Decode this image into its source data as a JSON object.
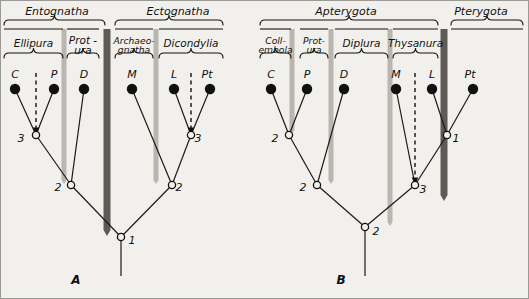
{
  "figure": {
    "background_color": "#f2f0ec",
    "ink_color": "#14120f",
    "light_bar_color": "#b9b6b0",
    "dark_bar_color": "#5e5b56",
    "panels": [
      {
        "id": "A",
        "label": "A",
        "label_x": 75,
        "label_y": 283,
        "upper_groups": [
          {
            "name": "Entognatha",
            "text_x": 56,
            "text_y": 14,
            "bracket_x1": 3,
            "bracket_x2": 104,
            "bracket_y": 24
          },
          {
            "name": "Ectognatha",
            "text_x": 177,
            "text_y": 14,
            "bracket_x1": 114,
            "bracket_x2": 222,
            "bracket_y": 24
          }
        ],
        "lower_groups": [
          {
            "name": "Ellipura",
            "lines": [
              "Ellipura"
            ],
            "text_x": 34,
            "text_y": 46,
            "bracket_x1": 3,
            "bracket_x2": 62,
            "bracket_y": 57,
            "small": false
          },
          {
            "name": "Protura",
            "lines": [
              "Prot -",
              "ura"
            ],
            "text_x": 80,
            "text_y": 43,
            "bracket_x1": 66,
            "bracket_x2": 98,
            "bracket_y": 57,
            "small": false
          },
          {
            "name": "Archaeognatha",
            "lines": [
              "Archaeo-",
              "gnatha"
            ],
            "text_x": 133,
            "text_y": 43,
            "bracket_x1": 114,
            "bracket_x2": 152,
            "bracket_y": 57,
            "small": true
          },
          {
            "name": "Dicondylia",
            "lines": [
              "Dicondylia"
            ],
            "text_x": 192,
            "text_y": 46,
            "bracket_x1": 158,
            "bracket_x2": 222,
            "bracket_y": 57,
            "small": false
          }
        ],
        "tips": [
          {
            "code": "C",
            "label_x": 11,
            "label_y": 77,
            "dot_x": 14,
            "dot_y": 88
          },
          {
            "code": "P",
            "label_x": 50,
            "label_y": 77,
            "dot_x": 53,
            "dot_y": 88
          },
          {
            "code": "D",
            "label_x": 80,
            "label_y": 77,
            "dot_x": 83,
            "dot_y": 88
          },
          {
            "code": "M",
            "label_x": 128,
            "label_y": 77,
            "dot_x": 131,
            "dot_y": 88
          },
          {
            "code": "L",
            "label_x": 170,
            "label_y": 77,
            "dot_x": 173,
            "dot_y": 88
          },
          {
            "code": "Pt",
            "label_x": 203,
            "label_y": 77,
            "dot_x": 209,
            "dot_y": 88
          }
        ],
        "nodes": [
          {
            "num": "1",
            "x": 120,
            "y": 236,
            "label_x": 131,
            "label_y": 243
          },
          {
            "num": "2",
            "x": 70,
            "y": 184,
            "label_x": 57,
            "label_y": 190
          },
          {
            "num": "2",
            "x": 171,
            "y": 184,
            "label_x": 178,
            "label_y": 190
          },
          {
            "num": "3",
            "x": 35,
            "y": 134,
            "label_x": 20,
            "label_y": 141
          },
          {
            "num": "3",
            "x": 190,
            "y": 134,
            "label_x": 197,
            "label_y": 141
          }
        ],
        "branches": [
          [
            14,
            88,
            35,
            134
          ],
          [
            53,
            88,
            35,
            134
          ],
          [
            35,
            134,
            70,
            184
          ],
          [
            83,
            88,
            70,
            184
          ],
          [
            70,
            184,
            120,
            236
          ],
          [
            131,
            88,
            171,
            184
          ],
          [
            171,
            184,
            120,
            236
          ],
          [
            173,
            88,
            190,
            134
          ],
          [
            209,
            88,
            190,
            134
          ],
          [
            190,
            134,
            171,
            184
          ],
          [
            120,
            236,
            120,
            275
          ]
        ],
        "arrows": [
          {
            "x": 35,
            "y1": 72,
            "y2": 130,
            "direction": "down",
            "dashed": true
          },
          {
            "x": 190,
            "y1": 72,
            "y2": 130,
            "direction": "down",
            "dashed": true
          }
        ],
        "light_bars": [
          {
            "x": 63,
            "y1": 28,
            "y2": 183
          },
          {
            "x": 155,
            "y1": 28,
            "y2": 183
          }
        ],
        "dark_bars": [
          {
            "x": 106,
            "y1": 28,
            "y2": 235
          }
        ]
      },
      {
        "id": "B",
        "label": "B",
        "label_x": 340,
        "label_y": 283,
        "upper_groups": [
          {
            "name": "Apterygota",
            "text_x": 345,
            "text_y": 14,
            "bracket_x1": 259,
            "bracket_x2": 437,
            "bracket_y": 24
          },
          {
            "name": "Pterygota",
            "text_x": 480,
            "text_y": 14,
            "bracket_x1": 450,
            "bracket_x2": 522,
            "bracket_y": 24
          }
        ],
        "lower_groups": [
          {
            "name": "Collembola",
            "lines": [
              "Coll-",
              "embola"
            ],
            "text_x": 275,
            "text_y": 43,
            "bracket_x1": 259,
            "bracket_x2": 290,
            "bracket_y": 57,
            "small": true
          },
          {
            "name": "Protura",
            "lines": [
              "Prot-",
              "ura"
            ],
            "text_x": 315,
            "text_y": 43,
            "bracket_x1": 299,
            "bracket_x2": 327,
            "bracket_y": 57,
            "small": true
          },
          {
            "name": "Diplura",
            "lines": [
              "Diplura"
            ],
            "text_x": 355,
            "text_y": 46,
            "bracket_x1": 334,
            "bracket_x2": 387,
            "bracket_y": 57,
            "small": false
          },
          {
            "name": "Thysanura",
            "lines": [
              "Thysanura"
            ],
            "text_x": 415,
            "text_y": 46,
            "bracket_x1": 392,
            "bracket_x2": 437,
            "bracket_y": 57,
            "small": false
          }
        ],
        "tips": [
          {
            "code": "C",
            "label_x": 267,
            "label_y": 77,
            "dot_x": 270,
            "dot_y": 88
          },
          {
            "code": "P",
            "label_x": 303,
            "label_y": 77,
            "dot_x": 306,
            "dot_y": 88
          },
          {
            "code": "D",
            "label_x": 340,
            "label_y": 77,
            "dot_x": 343,
            "dot_y": 88
          },
          {
            "code": "M",
            "label_x": 392,
            "label_y": 77,
            "dot_x": 395,
            "dot_y": 88
          },
          {
            "code": "L",
            "label_x": 428,
            "label_y": 77,
            "dot_x": 431,
            "dot_y": 88
          },
          {
            "code": "Pt",
            "label_x": 466,
            "label_y": 77,
            "dot_x": 472,
            "dot_y": 88
          }
        ],
        "nodes": [
          {
            "num": "1",
            "x": 446,
            "y": 134,
            "label_x": 455,
            "label_y": 141
          },
          {
            "num": "2",
            "x": 288,
            "y": 134,
            "label_x": 274,
            "label_y": 141
          },
          {
            "num": "2",
            "x": 316,
            "y": 184,
            "label_x": 302,
            "label_y": 190
          },
          {
            "num": "2",
            "x": 364,
            "y": 226,
            "label_x": 375,
            "label_y": 234
          },
          {
            "num": "3",
            "x": 414,
            "y": 184,
            "label_x": 422,
            "label_y": 192
          }
        ],
        "branches": [
          [
            270,
            88,
            288,
            134
          ],
          [
            306,
            88,
            288,
            134
          ],
          [
            288,
            134,
            316,
            184
          ],
          [
            343,
            88,
            316,
            184
          ],
          [
            316,
            184,
            364,
            226
          ],
          [
            395,
            88,
            414,
            184
          ],
          [
            414,
            184,
            364,
            226
          ],
          [
            431,
            88,
            446,
            134
          ],
          [
            472,
            88,
            446,
            134
          ],
          [
            446,
            134,
            414,
            184
          ],
          [
            364,
            226,
            364,
            275
          ]
        ],
        "arrows": [
          {
            "x": 414,
            "y1": 72,
            "y2": 180,
            "direction": "down",
            "dashed": true
          }
        ],
        "light_bars": [
          {
            "x": 291,
            "y1": 28,
            "y2": 133
          },
          {
            "x": 330,
            "y1": 28,
            "y2": 183
          },
          {
            "x": 389,
            "y1": 28,
            "y2": 225
          }
        ],
        "dark_bars": [
          {
            "x": 443,
            "y1": 28,
            "y2": 200
          }
        ]
      }
    ]
  }
}
